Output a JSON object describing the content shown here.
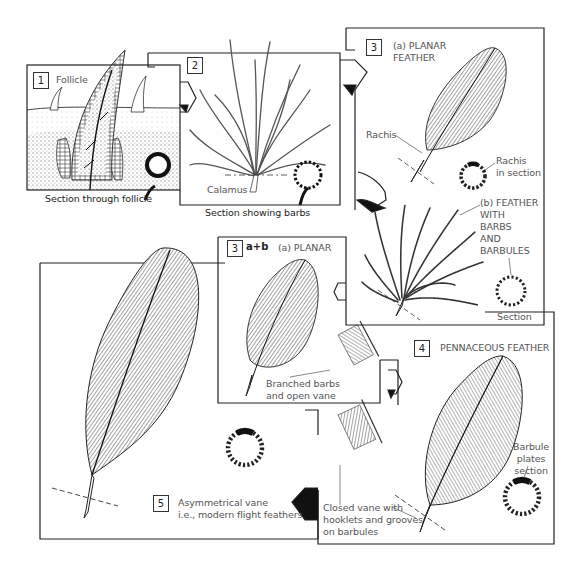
{
  "diagram": {
    "stages": [
      {
        "number": "1",
        "title": "Follicle",
        "caption": "Section through follicle"
      },
      {
        "number": "2",
        "labels": [
          "Calamus"
        ],
        "caption": "Section showing barbs"
      },
      {
        "number": "3",
        "title_a": "(a) PLANAR\nFEATHER",
        "labels_a": [
          "Rachis",
          "Rachis\nin section"
        ],
        "title_b": "(b) FEATHER\nWITH\nBARBS\nAND\nBARBULES",
        "labels_b": [
          "Section"
        ]
      },
      {
        "number": "3",
        "suffix": "a+b",
        "title": "(a) PLANAR",
        "labels": [
          "Branched barbs\nand open vane"
        ]
      },
      {
        "number": "4",
        "title": "PENNACEOUS FEATHER",
        "labels": [
          "Barbule\nplates\nsection",
          "Closed vane with\nhooklets and grooves\non barbules"
        ]
      },
      {
        "number": "5",
        "title": "Asymmetrical vane\ni.e., modern flight feathers"
      }
    ]
  },
  "colors": {
    "ink": "#222222",
    "label": "#555555",
    "background": "#ffffff"
  }
}
